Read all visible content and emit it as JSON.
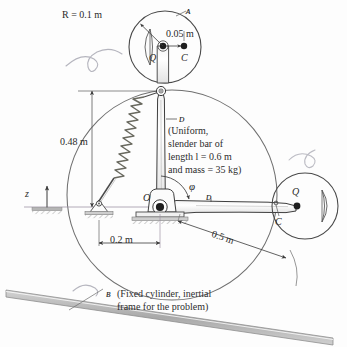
{
  "figure": {
    "colors": {
      "line": "#3a3a3a",
      "light_line": "#8c8c8c",
      "text": "#2a2a2a",
      "hatch": "#b9b9b9",
      "ground_bar": "#b0b0b0",
      "background": "#fdfdfd"
    }
  },
  "labels": {
    "radius": "R = 0.1 m",
    "offset_qc": "0.05 m",
    "height": "0.48 m",
    "base_offset": "0.2 m",
    "arm_length": "0.5 m",
    "body_a": "ᴀ",
    "body_d_top": "ᴅ",
    "body_d_bar": "ᴅ",
    "body_b": "ʙ",
    "point_q_top": "Q",
    "point_c_top": "C",
    "point_q_right": "Q",
    "point_c_right": "C",
    "point_o": "O",
    "axis_z": "z",
    "angle_phi": "φ",
    "bar_note_line1": "(Uniform,",
    "bar_note_line2": "slender bar of",
    "bar_note_line3": "length  l = 0.6 m",
    "bar_note_line4": "and mass = 35 kg)",
    "cylinder_note_line1": "(Fixed cylinder, inertial",
    "cylinder_note_line2": "frame for the problem)"
  },
  "geometry": {
    "top_disc": {
      "cx": 165,
      "cy": 47,
      "r": 36
    },
    "right_disc": {
      "cx": 305,
      "cy": 206,
      "r": 33
    },
    "big_cylinder": {
      "cx": 172,
      "cy": 195,
      "r": 105
    },
    "pivot_o": {
      "x": 160,
      "y": 207
    },
    "top_pin": {
      "x": 161,
      "y": 91
    },
    "spring_base": {
      "x": 99,
      "y": 208
    }
  },
  "values": {
    "R_m": 0.1,
    "QC_offset_m": 0.05,
    "height_m": 0.48,
    "base_offset_m": 0.2,
    "arm_length_m": 0.5,
    "bar_length_m": 0.6,
    "bar_mass_kg": 35
  }
}
